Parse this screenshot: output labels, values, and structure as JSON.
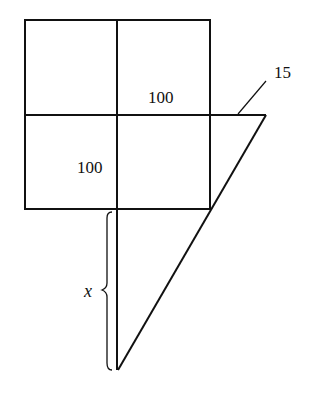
{
  "diagram": {
    "labels": {
      "top_right_cell": "100",
      "bottom_left_cell": "100",
      "overhang": "15",
      "brace_variable": "x"
    },
    "colors": {
      "stroke": "#111111",
      "background": "#ffffff"
    }
  }
}
